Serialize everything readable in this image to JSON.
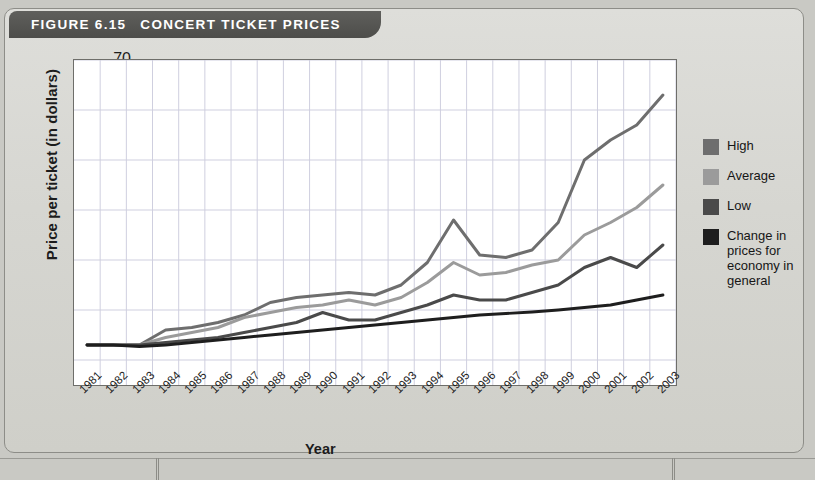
{
  "figure": {
    "number": "FIGURE 6.15",
    "title": "CONCERT TICKET PRICES",
    "source": "Source: Journal of Labor Economics, 2005."
  },
  "legend": {
    "items": [
      {
        "label": "High",
        "color": "#6e6e6e"
      },
      {
        "label": "Average",
        "color": "#9b9b9b"
      },
      {
        "label": "Low",
        "color": "#4a4a4a"
      },
      {
        "label": "Change in prices for economy in general",
        "color": "#1e1e1e"
      }
    ]
  },
  "chart_data": {
    "type": "line",
    "title": "CONCERT TICKET PRICES",
    "xlabel": "Year",
    "ylabel": "Price per ticket (in dollars)",
    "categories": [
      "1981",
      "1982",
      "1983",
      "1984",
      "1985",
      "1986",
      "1987",
      "1988",
      "1989",
      "1990",
      "1991",
      "1992",
      "1993",
      "1994",
      "1995",
      "1996",
      "1997",
      "1998",
      "1999",
      "2000",
      "2001",
      "2002",
      "2003"
    ],
    "yticks": [
      10,
      20,
      30,
      40,
      50,
      60,
      70
    ],
    "ylim": [
      5,
      70
    ],
    "grid": true,
    "legend_position": "right",
    "series": [
      {
        "name": "High",
        "color": "#6e6e6e",
        "values": [
          13.0,
          13.0,
          13.0,
          16.0,
          16.5,
          17.5,
          19.0,
          21.5,
          22.5,
          23.0,
          23.5,
          23.0,
          25.0,
          29.5,
          38.0,
          31.0,
          30.5,
          32.0,
          37.5,
          50.0,
          54.0,
          57.0,
          63.0
        ]
      },
      {
        "name": "Average",
        "color": "#9b9b9b",
        "values": [
          13.0,
          13.0,
          13.0,
          14.5,
          15.5,
          16.5,
          18.5,
          19.5,
          20.5,
          21.0,
          22.0,
          21.0,
          22.5,
          25.5,
          29.5,
          27.0,
          27.5,
          29.0,
          30.0,
          35.0,
          37.5,
          40.5,
          45.0
        ]
      },
      {
        "name": "Low",
        "color": "#4a4a4a",
        "values": [
          13.0,
          13.0,
          13.0,
          13.5,
          14.0,
          14.5,
          15.5,
          16.5,
          17.5,
          19.5,
          18.0,
          18.0,
          19.5,
          21.0,
          23.0,
          22.0,
          22.0,
          23.5,
          25.0,
          28.5,
          30.5,
          28.5,
          33.0
        ]
      },
      {
        "name": "Change in prices for economy in general",
        "color": "#1e1e1e",
        "values": [
          13.0,
          13.0,
          12.7,
          13.0,
          13.5,
          14.0,
          14.5,
          15.0,
          15.5,
          16.0,
          16.5,
          17.0,
          17.5,
          18.0,
          18.5,
          19.0,
          19.3,
          19.6,
          20.0,
          20.5,
          21.0,
          22.0,
          23.0
        ]
      }
    ]
  }
}
